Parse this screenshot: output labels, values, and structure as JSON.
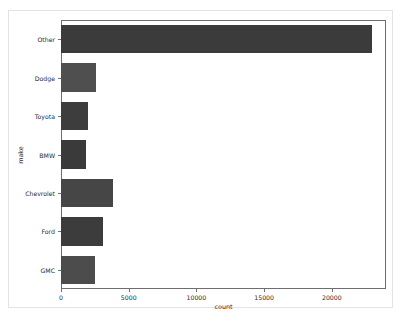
{
  "chart_data": {
    "type": "bar",
    "orientation": "horizontal",
    "title": "",
    "xlabel": "count",
    "ylabel": "make",
    "categories": [
      "Other",
      "Dodge",
      "Toyota",
      "BMW",
      "Chevrolet",
      "Ford",
      "GMC"
    ],
    "values": [
      23000,
      2600,
      2000,
      1850,
      3850,
      3100,
      2500
    ],
    "xlim": [
      0,
      24000
    ],
    "xticks": [
      0,
      5000,
      10000,
      15000,
      20000
    ],
    "xtick_labels": [
      "0",
      "5000",
      "10000",
      "15000",
      "20000"
    ],
    "grid": false,
    "legend": null,
    "bar_colors": [
      "#3b3b3b",
      "#4f4f4f",
      "#3d3d3d",
      "#3a3a3a",
      "#464646",
      "#3c3c3c",
      "#4c4c4c"
    ],
    "figure_background": "#ffffff",
    "axes_edge_color": "#6e6e6e",
    "text_color": "#2b2b2b"
  }
}
